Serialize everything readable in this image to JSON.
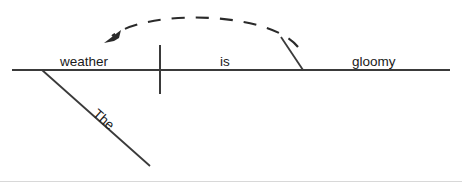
{
  "diagram": {
    "type": "reed-kellogg-sentence-diagram",
    "sentence": "The weather is gloomy",
    "colors": {
      "line": "#3a3a3a",
      "arc": "#2a2a2a",
      "text": "#1a1a1a",
      "background": "#ffffff",
      "footer_rule": "#d8d8d8"
    },
    "words": {
      "subject": "weather",
      "verb": "is",
      "predicate_adjective": "gloomy",
      "article_modifier": "The"
    },
    "parts": {
      "baseline_name": "baseline",
      "divider_name": "subject-verb-divider",
      "slant_name": "predicate-adjective-slant",
      "modifier_name": "article-modifier-line",
      "arc_name": "modifier-reference-arc",
      "arrow_name": "arc-arrowhead"
    }
  }
}
